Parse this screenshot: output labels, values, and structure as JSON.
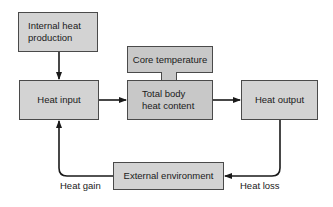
{
  "diagram": {
    "nodes": {
      "internal_heat_production": {
        "label": "Internal heat production"
      },
      "heat_input": {
        "label": "Heat input"
      },
      "core_temperature": {
        "label": "Core temperature"
      },
      "total_body_heat_content": {
        "label": "Total body heat content"
      },
      "heat_output": {
        "label": "Heat output"
      },
      "external_environment": {
        "label": "External environment"
      }
    },
    "edges": [
      {
        "from": "internal_heat_production",
        "to": "heat_input",
        "label": ""
      },
      {
        "from": "heat_input",
        "to": "total_body_heat_content",
        "label": ""
      },
      {
        "from": "total_body_heat_content",
        "to": "heat_output",
        "label": ""
      },
      {
        "from": "heat_output",
        "to": "external_environment",
        "label": "Heat loss"
      },
      {
        "from": "external_environment",
        "to": "heat_input",
        "label": "Heat gain"
      }
    ],
    "edge_labels": {
      "heat_gain": "Heat gain",
      "heat_loss": "Heat loss"
    },
    "colors": {
      "box_fill": "#d3d3d3",
      "center_fill": "#c8c8c8",
      "stroke": "#2a2a2a"
    }
  }
}
